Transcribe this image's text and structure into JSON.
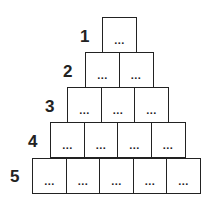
{
  "pyramid": {
    "rows": [
      {
        "label": "1",
        "cells": [
          "...",
          ""
        ]
      },
      {
        "label": "2",
        "cells": [
          "...",
          "..."
        ]
      },
      {
        "label": "3",
        "cells": [
          "...",
          "...",
          "..."
        ]
      },
      {
        "label": "4",
        "cells": [
          "...",
          "...",
          "...",
          "..."
        ]
      },
      {
        "label": "5",
        "cells": [
          "...",
          "...",
          "...",
          "...",
          "..."
        ]
      }
    ]
  }
}
